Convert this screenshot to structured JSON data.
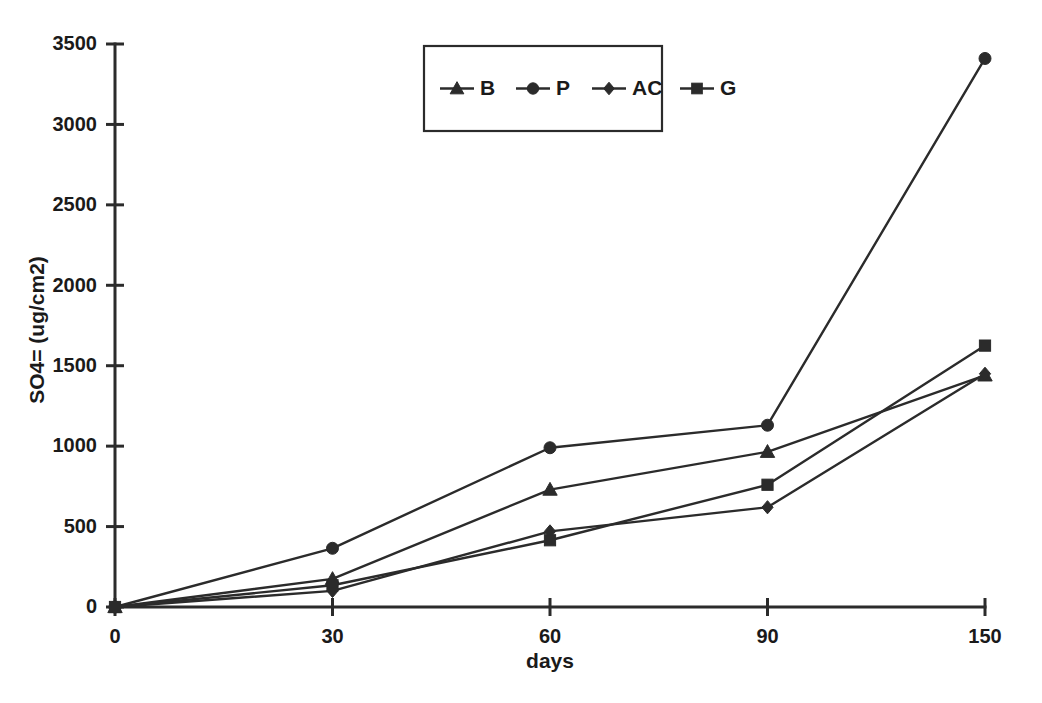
{
  "chart_data": {
    "type": "line",
    "title": "",
    "xlabel": "days",
    "ylabel": "SO4= (ug/cm2)",
    "x": [
      0,
      30,
      60,
      90,
      150
    ],
    "x_tick_labels": [
      "0",
      "30",
      "60",
      "90",
      "150"
    ],
    "x_scale": "categorical",
    "ylim": [
      0,
      3500
    ],
    "y_ticks": [
      0,
      500,
      1000,
      1500,
      2000,
      2500,
      3000,
      3500
    ],
    "y_tick_labels": [
      "0",
      "500",
      "1000",
      "1500",
      "2000",
      "2500",
      "3000",
      "3500"
    ],
    "grid": false,
    "legend_position": "top-center",
    "series": [
      {
        "name": "B",
        "marker": "triangle",
        "color": "#2b2b2b",
        "values": [
          0,
          175,
          730,
          965,
          1440
        ]
      },
      {
        "name": "P",
        "marker": "circle",
        "color": "#2b2b2b",
        "values": [
          0,
          365,
          990,
          1130,
          3410
        ]
      },
      {
        "name": "AC",
        "marker": "diamond",
        "color": "#2b2b2b",
        "values": [
          0,
          100,
          470,
          620,
          1450
        ]
      },
      {
        "name": "G",
        "marker": "square",
        "color": "#2b2b2b",
        "values": [
          0,
          135,
          415,
          760,
          1625
        ]
      }
    ]
  },
  "legend": {
    "items": [
      {
        "label": "B",
        "marker": "triangle"
      },
      {
        "label": "P",
        "marker": "circle"
      },
      {
        "label": "AC",
        "marker": "diamond"
      },
      {
        "label": "G",
        "marker": "square"
      }
    ]
  }
}
